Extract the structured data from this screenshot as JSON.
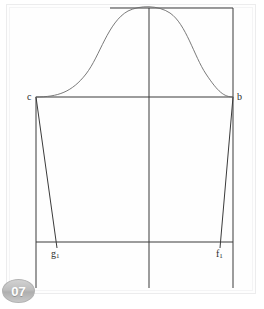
{
  "page": {
    "number_badge": "07",
    "background_color": "#ffffff",
    "line_color": "#3a3a3a",
    "curve_color": "#6b6b6b"
  },
  "drawing": {
    "title": "sleeve-pattern-draft",
    "points": [
      {
        "id": "c",
        "label": "c",
        "sub": "",
        "x": 36,
        "y": 97,
        "label_x": 27,
        "label_y": 97
      },
      {
        "id": "b",
        "label": "b",
        "sub": "",
        "x": 233,
        "y": 97,
        "label_x": 237,
        "label_y": 97
      },
      {
        "id": "g1",
        "label": "g",
        "sub": "1",
        "x": 57,
        "y": 242,
        "label_x": 51,
        "label_y": 254
      },
      {
        "id": "f1",
        "label": "f",
        "sub": "1",
        "x": 220,
        "y": 242,
        "label_x": 216,
        "label_y": 254
      }
    ],
    "lines": [
      {
        "name": "top-horizontal-line",
        "x1": 110,
        "y1": 8,
        "x2": 233,
        "y2": 8
      },
      {
        "name": "right-vertical-edge",
        "x1": 233,
        "y1": 8,
        "x2": 233,
        "y2": 288
      },
      {
        "name": "center-vertical-line",
        "x1": 149,
        "y1": 8,
        "x2": 149,
        "y2": 288
      },
      {
        "name": "left-vertical-edge",
        "x1": 36,
        "y1": 97,
        "x2": 36,
        "y2": 288
      },
      {
        "name": "biceps-horizontal-line",
        "x1": 36,
        "y1": 97,
        "x2": 233,
        "y2": 97
      },
      {
        "name": "hem-horizontal-line",
        "x1": 36,
        "y1": 242,
        "x2": 233,
        "y2": 242
      },
      {
        "name": "left-underarm-seam",
        "x1": 36,
        "y1": 97,
        "x2": 57,
        "y2": 248
      },
      {
        "name": "right-underarm-seam",
        "x1": 233,
        "y1": 97,
        "x2": 220,
        "y2": 248
      }
    ],
    "curve": {
      "name": "sleeve-cap-curve",
      "description": "bell-shaped sleeve cap from c to b peaking at the top line",
      "path": "M 36 97 C 58 97 72 92 86 74 C 100 56 108 22 128 11 C 140 5 158 5 170 13 C 186 24 194 56 206 74 C 218 92 224 97 233 97"
    }
  }
}
